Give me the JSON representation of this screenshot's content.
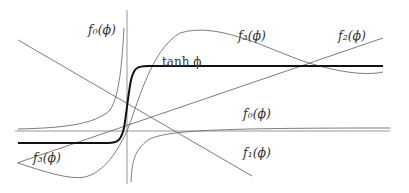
{
  "figure": {
    "labels": {
      "f0_top": "f₀(ϕ)",
      "f0_bottom": "f₀(ϕ)",
      "f1": "f₁(ϕ)",
      "f2": "f₂(ϕ)",
      "f3_top": "f₃(ϕ)",
      "f3_bottom": "f₃(ϕ)",
      "tanh": "tanh ϕ"
    },
    "colors": {
      "thin_curves": "#6e6e6e",
      "axes": "#8a8a8a",
      "tanh": "#111111",
      "background": "#ffffff"
    }
  }
}
